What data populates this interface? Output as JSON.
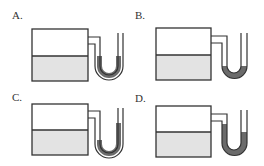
{
  "options": [
    {
      "label": "A.",
      "description": "Left arm of U-tube liquid higher than right arm",
      "left_level": "high",
      "right_level": "high-equal"
    },
    {
      "label": "B.",
      "description": "Liquid only at bottom of U-tube, both arms low and equal",
      "left_level": "low",
      "right_level": "low"
    },
    {
      "label": "C.",
      "description": "Left arm liquid lower than right arm",
      "left_level": "low",
      "right_level": "high"
    },
    {
      "label": "D.",
      "description": "Left arm liquid higher than right arm",
      "left_level": "high",
      "right_level": "low"
    }
  ],
  "colors": {
    "outline": "#333333",
    "water": "#e3e3e3",
    "manometer_liquid": "#6b6b6b"
  }
}
